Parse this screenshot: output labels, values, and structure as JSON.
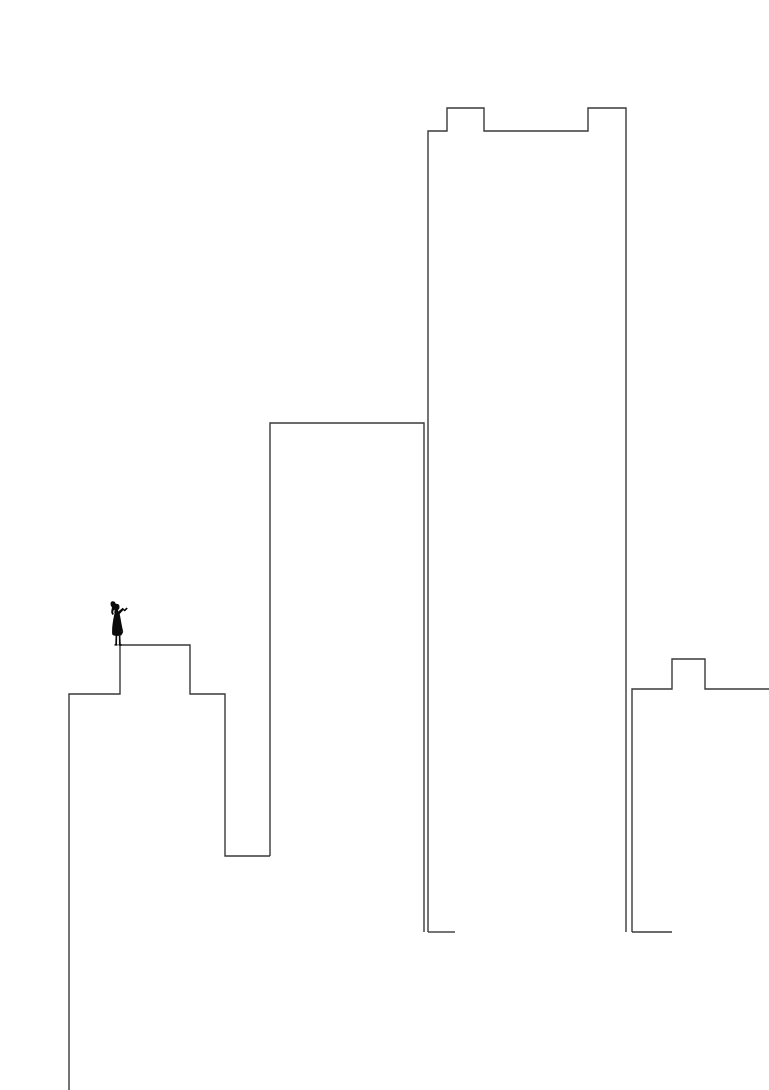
{
  "artwork": {
    "title": "Girl on Rooftop City Skyline",
    "medium": "line-drawing",
    "canvas": {
      "width": 769,
      "height": 1090
    },
    "background_color": "#ffffff",
    "stroke_color": "#3a3a3a",
    "stroke_width": 1.4,
    "figure_color": "#0a0a0a"
  },
  "scene": {
    "description": "Minimalist outline drawing of four building silhouettes of varying heights with a small solid-black silhouette of a girl standing on the ledge of the shortest left-hand building.",
    "elements": [
      {
        "name": "building-left",
        "label": "Left low building with stepped ledge",
        "outline_points": "69,1090 69,694 120,694 120,645 190,645 190,694 225,694 225,856 270,856",
        "top_y": 645,
        "base_y": 1090
      },
      {
        "name": "building-second",
        "label": "Second mid-height building",
        "outline_points": "270,856 270,423 424,423 424,932",
        "top_y": 423,
        "base_y": 932
      },
      {
        "name": "building-tall",
        "label": "Tallest building with crown step",
        "outline_points": "428,932 428,131 447,131 447,108 484,108 484,131 588,131 588,108 626,108 626,131 626,932",
        "top_y": 108,
        "base_y": 932
      },
      {
        "name": "building-right",
        "label": "Right short building with raised block",
        "outline_points": "632,932 632,689 672,689 672,659 705,659 705,689 738,689 738,689 769,689",
        "top_y": 659,
        "base_y": 932
      }
    ],
    "figure": {
      "name": "girl-silhouette",
      "label": "Girl standing on rooftop ledge with arm raised and ponytail",
      "position": {
        "x": 107,
        "y": 601,
        "width": 26,
        "height": 45
      },
      "standing_on": "building-left",
      "pose": "arm-raised"
    }
  }
}
